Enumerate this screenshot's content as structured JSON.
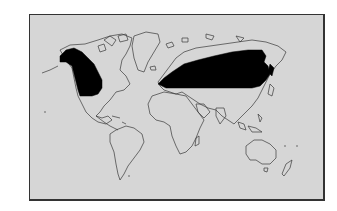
{
  "map": {
    "type": "world distribution map",
    "projection": "world outline, monochrome",
    "colors": {
      "ocean": "#d6d6d6",
      "land_outline": "#3a3a3a",
      "range_fill": "#000000",
      "frame": "#333333",
      "page": "#ffffff"
    },
    "highlighted_regions": [
      {
        "name": "Western North America (Alaska, western Canada, NW United States)"
      },
      {
        "name": "Northern Eurasia (northern Europe to eastern Siberia, Japan area)"
      }
    ]
  }
}
